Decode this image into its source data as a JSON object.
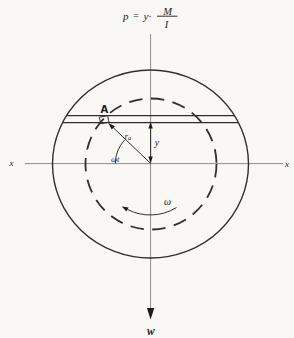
{
  "figure": {
    "formula": {
      "p": "p",
      "equals": "=",
      "y_factor": "y·",
      "numerator": "M",
      "denominator": "I"
    },
    "labels": {
      "point": "A",
      "radius_base": "r",
      "radius_sub": "a",
      "angle": "ωt",
      "y_dim": "y",
      "omega": "ω",
      "weight": "w",
      "x_left": "x",
      "x_right": "x"
    },
    "colors": {
      "background": "#f9f8f5",
      "line": "#2f2f2f",
      "axis": "#8d8d8d",
      "text": "#1c1c1c"
    }
  }
}
